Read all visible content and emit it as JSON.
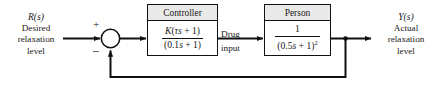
{
  "diagram": {
    "type": "control-system-block-diagram",
    "background": "#ffffff",
    "line_color": "#111111",
    "header_fill": "#e9e9e9"
  },
  "input": {
    "symbol": "R(s)",
    "symbol_var": "R",
    "symbol_paren_open": "(",
    "symbol_arg": "s",
    "symbol_paren_close": ")",
    "line1": "Desired",
    "line2": "relaxation",
    "line3": "level"
  },
  "output": {
    "symbol": "Y(s)",
    "symbol_var": "Y",
    "symbol_paren_open": "(",
    "symbol_arg": "s",
    "symbol_paren_close": ")",
    "line1": "Actual",
    "line2": "relaxation",
    "line3": "level"
  },
  "summing_junction": {
    "name": "summing-junction",
    "plus_sign": "+",
    "minus_sign": "−",
    "reference_input_sign": "+",
    "feedback_input_sign": "−"
  },
  "controller": {
    "title": "Controller",
    "numerator": "K(τs + 1)",
    "denominator": "(0.1s + 1)",
    "num_gain": "K",
    "num_open": "(",
    "num_tau": "τ",
    "num_s": "s",
    "num_plus": " + 1)",
    "den_open": "(0.1",
    "den_s": "s",
    "den_close": " + 1)"
  },
  "signal_drug": {
    "line1": "Drug",
    "line2": "input"
  },
  "person": {
    "title": "Person",
    "numerator": "1",
    "denominator": "(0.5s + 1)²",
    "den_open": "(0.5",
    "den_s": "s",
    "den_close": " + 1)",
    "den_exponent": "2"
  },
  "feedback": {
    "name": "unity-feedback-path",
    "description": "takeoff from output to summing junction minus input"
  }
}
